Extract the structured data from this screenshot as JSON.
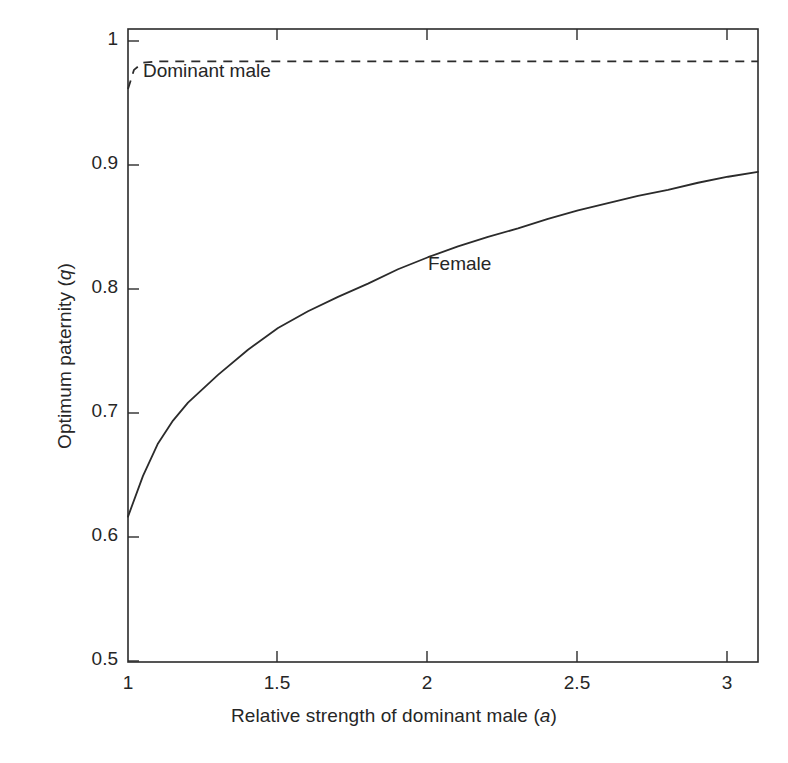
{
  "figure": {
    "background": "#ffffff",
    "ink_color": "#2b2b2b"
  },
  "chart_data": {
    "type": "line",
    "title": "",
    "xlabel": "Relative strength of dominant male (a)",
    "xlabel_prefix": "Relative strength of dominant male (",
    "xlabel_var": "a",
    "xlabel_suffix": ")",
    "ylabel": "Optimum paternity (q)",
    "ylabel_prefix": "Optimum paternity (",
    "ylabel_var": "q",
    "ylabel_suffix": ")",
    "xlim": [
      1,
      3.1
    ],
    "ylim": [
      0.5,
      1.027
    ],
    "grid": false,
    "legend_position": "inline-annotations",
    "xticks": [
      1,
      1.5,
      2,
      2.5,
      3
    ],
    "xtick_labels": [
      "1",
      "1.5",
      "2",
      "2.5",
      "3"
    ],
    "yticks": [
      0.5,
      0.6,
      0.7,
      0.8,
      0.9,
      1
    ],
    "ytick_labels": [
      "0.5",
      "0.6",
      "0.7",
      "0.8",
      "0.9",
      "1"
    ],
    "series": [
      {
        "name": "Dominant male",
        "style": "dashed",
        "label_x": 1.13,
        "label_y": 0.963,
        "x": [
          1.0,
          1.02,
          1.05,
          1.1,
          1.2,
          1.5,
          2.0,
          2.5,
          3.0,
          3.1
        ],
        "values": [
          0.977,
          0.993,
          0.999,
          1.0,
          1.0,
          1.0,
          1.0,
          1.0,
          1.0,
          1.0
        ]
      },
      {
        "name": "Female",
        "style": "solid",
        "label_x": 2.02,
        "label_y": 0.826,
        "x": [
          1.0,
          1.05,
          1.1,
          1.15,
          1.2,
          1.3,
          1.4,
          1.5,
          1.6,
          1.7,
          1.8,
          1.9,
          2.0,
          2.1,
          2.2,
          2.3,
          2.4,
          2.5,
          2.6,
          2.7,
          2.8,
          2.9,
          3.0,
          3.1
        ],
        "values": [
          0.621,
          0.655,
          0.682,
          0.701,
          0.716,
          0.739,
          0.76,
          0.778,
          0.792,
          0.804,
          0.815,
          0.827,
          0.837,
          0.846,
          0.854,
          0.861,
          0.869,
          0.876,
          0.882,
          0.888,
          0.893,
          0.899,
          0.904,
          0.908
        ]
      }
    ]
  }
}
